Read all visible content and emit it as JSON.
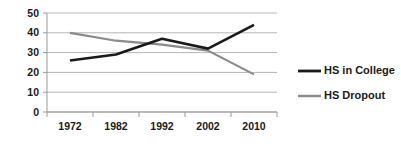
{
  "chart_data": {
    "type": "line",
    "title": "",
    "subtitle": "",
    "xlabel": "",
    "ylabel": "",
    "categories": [
      "1972",
      "1982",
      "1992",
      "2002",
      "2010"
    ],
    "series": [
      {
        "name": "HS in College",
        "color": "#1a1a1a",
        "values": [
          26,
          29,
          37,
          32,
          44
        ]
      },
      {
        "name": "HS Dropout",
        "color": "#8a8a8a",
        "values": [
          40,
          36,
          34,
          31,
          19
        ]
      }
    ],
    "ylim": [
      0,
      50
    ],
    "ytick_values": [
      0,
      10,
      20,
      30,
      40,
      50
    ],
    "ytick_labels": [
      "0",
      "10",
      "20",
      "30",
      "40",
      "50"
    ],
    "grid": true,
    "grid_color": "#b5b5b5",
    "legend_position": "right",
    "axis_color": "#9a9a9a",
    "background": "#ffffff"
  },
  "legend": {
    "items": [
      {
        "label": "HS in College",
        "color": "#1a1a1a"
      },
      {
        "label": "HS Dropout",
        "color": "#8a8a8a"
      }
    ]
  }
}
